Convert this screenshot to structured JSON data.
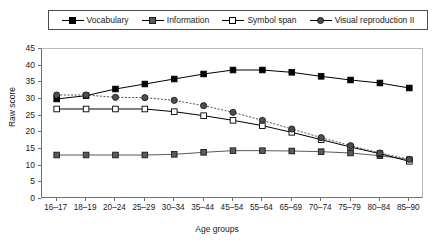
{
  "chart_data": {
    "type": "line",
    "title": "",
    "xlabel": "Age groups",
    "ylabel": "Raw score",
    "categories": [
      "16–17",
      "18–19",
      "20–24",
      "25–29",
      "30–34",
      "35–44",
      "45–54",
      "55–64",
      "65–69",
      "70–74",
      "75–79",
      "80–84",
      "85–90"
    ],
    "ylim": [
      0,
      45
    ],
    "yticks": [
      0,
      5,
      10,
      15,
      20,
      25,
      30,
      35,
      40,
      45
    ],
    "grid": false,
    "legend_position": "top",
    "series": [
      {
        "name": "Vocabulary",
        "marker": "filled-square",
        "color": "#000000",
        "linestyle": "solid",
        "values": [
          30.0,
          31.0,
          33.0,
          34.5,
          36.0,
          37.5,
          38.7,
          38.7,
          38.0,
          36.8,
          35.7,
          34.8,
          33.3
        ]
      },
      {
        "name": "Information",
        "marker": "gray-square",
        "color": "#5a5a5a",
        "linestyle": "solid",
        "values": [
          13.2,
          13.2,
          13.2,
          13.2,
          13.4,
          14.0,
          14.5,
          14.5,
          14.4,
          14.2,
          13.8,
          13.0,
          11.8
        ]
      },
      {
        "name": "Symbol span",
        "marker": "open-square",
        "color": "#000000",
        "linestyle": "solid",
        "values": [
          27.0,
          27.0,
          27.0,
          27.0,
          26.2,
          25.0,
          23.6,
          22.0,
          20.0,
          17.8,
          15.6,
          13.6,
          11.3
        ]
      },
      {
        "name": "Visual reproduction II",
        "marker": "filled-circle",
        "color": "#4f4f4f",
        "linestyle": "dotted",
        "values": [
          31.2,
          31.2,
          30.5,
          30.4,
          29.6,
          28.0,
          26.0,
          23.6,
          21.0,
          18.4,
          16.0,
          13.8,
          11.9
        ]
      }
    ]
  },
  "legend": {
    "items": [
      {
        "label": "Vocabulary",
        "marker": "filled-square"
      },
      {
        "label": "Information",
        "marker": "gray-square"
      },
      {
        "label": "Symbol span",
        "marker": "open-square"
      },
      {
        "label": "Visual reproduction II",
        "marker": "filled-circle"
      }
    ]
  },
  "axes": {
    "y_title": "Raw score",
    "x_title": "Age groups"
  }
}
